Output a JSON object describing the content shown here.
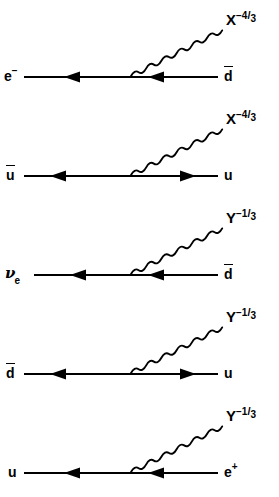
{
  "figure": {
    "type": "diagram",
    "background_color": "#ffffff",
    "line_color": "#000000",
    "width": 279,
    "height": 497,
    "diagram_count": 5
  },
  "diagrams": [
    {
      "id": "diagram-1",
      "incoming": {
        "symbol": "e",
        "superscript": "−",
        "subscript": "",
        "antiparticle": false,
        "arrow_direction": "right",
        "display": "e⁻"
      },
      "outgoing": {
        "symbol": "d",
        "superscript": "",
        "subscript": "",
        "antiparticle": true,
        "arrow_direction": "left",
        "display": "d̄"
      },
      "boson": {
        "symbol": "X",
        "charge_sign": "−",
        "charge_numerator": "4",
        "charge_denominator": "3",
        "display": "X^−4/3",
        "line_style": "wavy"
      }
    },
    {
      "id": "diagram-2",
      "incoming": {
        "symbol": "u",
        "superscript": "",
        "subscript": "",
        "antiparticle": true,
        "arrow_direction": "left",
        "display": "ū"
      },
      "outgoing": {
        "symbol": "u",
        "superscript": "",
        "subscript": "",
        "antiparticle": false,
        "arrow_direction": "right",
        "display": "u"
      },
      "boson": {
        "symbol": "X",
        "charge_sign": "−",
        "charge_numerator": "4",
        "charge_denominator": "3",
        "display": "X^−4/3",
        "line_style": "wavy"
      }
    },
    {
      "id": "diagram-3",
      "incoming": {
        "symbol": "ν",
        "superscript": "",
        "subscript": "e",
        "antiparticle": false,
        "arrow_direction": "right",
        "display": "νₑ"
      },
      "outgoing": {
        "symbol": "d",
        "superscript": "",
        "subscript": "",
        "antiparticle": true,
        "arrow_direction": "left",
        "display": "d̄"
      },
      "boson": {
        "symbol": "Y",
        "charge_sign": "−",
        "charge_numerator": "1",
        "charge_denominator": "3",
        "display": "Y^−1/3",
        "line_style": "wavy"
      }
    },
    {
      "id": "diagram-4",
      "incoming": {
        "symbol": "d",
        "superscript": "",
        "subscript": "",
        "antiparticle": true,
        "arrow_direction": "left",
        "display": "d̄"
      },
      "outgoing": {
        "symbol": "u",
        "superscript": "",
        "subscript": "",
        "antiparticle": false,
        "arrow_direction": "right",
        "display": "u"
      },
      "boson": {
        "symbol": "Y",
        "charge_sign": "−",
        "charge_numerator": "1",
        "charge_denominator": "3",
        "display": "Y^−1/3",
        "line_style": "wavy"
      }
    },
    {
      "id": "diagram-5",
      "incoming": {
        "symbol": "u",
        "superscript": "",
        "subscript": "",
        "antiparticle": false,
        "arrow_direction": "right",
        "display": "u"
      },
      "outgoing": {
        "symbol": "e",
        "superscript": "+",
        "subscript": "",
        "antiparticle": false,
        "arrow_direction": "left",
        "display": "e⁺"
      },
      "boson": {
        "symbol": "Y",
        "charge_sign": "−",
        "charge_numerator": "1",
        "charge_denominator": "3",
        "display": "Y^−1/3",
        "line_style": "wavy"
      }
    }
  ]
}
